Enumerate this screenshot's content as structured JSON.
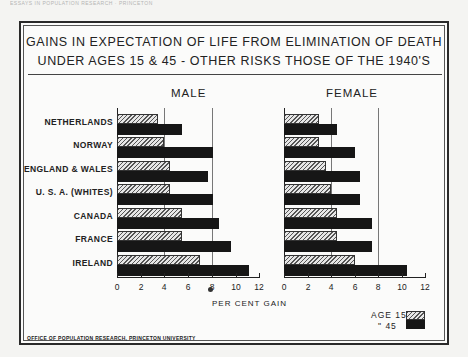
{
  "header": {
    "text": "ESSAYS IN POPULATION RESEARCH · PRINCETON"
  },
  "chart_data": {
    "type": "bar",
    "orientation": "horizontal",
    "title_lines": [
      "GAINS IN EXPECTATION OF LIFE FROM ELIMINATION OF DEATH",
      "UNDER AGES 15 & 45 - OTHER RISKS THOSE OF THE 1940'S"
    ],
    "xlabel": "PER CENT GAIN",
    "ylabel": "",
    "xlim": [
      0,
      12
    ],
    "xticks": [
      0,
      2,
      4,
      6,
      8,
      10,
      12
    ],
    "grid": {
      "vertical_lines_at": [
        4,
        8
      ]
    },
    "categories": [
      "NETHERLANDS",
      "NORWAY",
      "ENGLAND & WALES",
      "U. S. A. (WHITES)",
      "CANADA",
      "FRANCE",
      "IRELAND"
    ],
    "legend": [
      {
        "label": "AGE 15",
        "pattern": "hatched"
      },
      {
        "label": "\" 45",
        "pattern": "solid"
      }
    ],
    "legend_position": "lower right",
    "panels": [
      {
        "name": "MALE",
        "series": [
          {
            "name": "AGE 15",
            "values": [
              3.5,
              4.0,
              4.5,
              4.5,
              5.5,
              5.5,
              7.0
            ]
          },
          {
            "name": "AGE 45",
            "values": [
              5.5,
              8.1,
              7.7,
              8.1,
              8.6,
              9.6,
              11.1
            ]
          }
        ]
      },
      {
        "name": "FEMALE",
        "series": [
          {
            "name": "AGE 15",
            "values": [
              3.0,
              3.0,
              3.6,
              4.0,
              4.5,
              4.5,
              6.0
            ]
          },
          {
            "name": "AGE 45",
            "values": [
              4.5,
              6.0,
              6.5,
              6.5,
              7.5,
              7.5,
              10.5
            ]
          }
        ]
      }
    ]
  },
  "footer": {
    "source": "OFFICE OF POPULATION RESEARCH, PRINCETON UNIVERSITY"
  }
}
